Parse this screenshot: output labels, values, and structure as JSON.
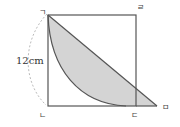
{
  "diagram": {
    "type": "geometry",
    "shape": "square with extended base, quarter-circle arc and diagonal",
    "points": {
      "top_left": "ㄱ",
      "bottom_left": "ㄴ",
      "bottom_right": "ㄷ",
      "top_right": "ㄹ",
      "extended": "ㅁ"
    },
    "side_length_label": "12cm",
    "colors": {
      "line": "#555555",
      "shade": "#d4d4d4",
      "dashed": "#999999"
    }
  }
}
